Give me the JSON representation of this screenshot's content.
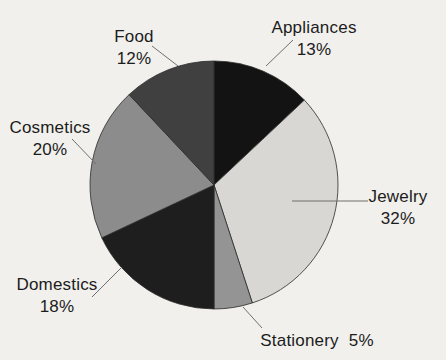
{
  "figure": {
    "background_color": "#f1f0ec",
    "text_color": "#1c1c1c",
    "leader_line_color": "#6f6f6f",
    "outline_color": "#2b2b2b"
  },
  "chart_data": {
    "type": "pie",
    "title": "",
    "direction": "clockwise",
    "start_angle_deg": 0,
    "total": 100,
    "legend_position": "none",
    "label_style": "outside-with-leader-lines",
    "slices": [
      {
        "label": "Appliances",
        "value": 13,
        "pct_text": "13%",
        "color": "#131313"
      },
      {
        "label": "Jewelry",
        "value": 32,
        "pct_text": "32%",
        "color": "#d8d7d3"
      },
      {
        "label": "Stationery",
        "value": 5,
        "pct_text": "5%",
        "color": "#949494"
      },
      {
        "label": "Domestics",
        "value": 18,
        "pct_text": "18%",
        "color": "#1e1e1e"
      },
      {
        "label": "Cosmetics",
        "value": 20,
        "pct_text": "20%",
        "color": "#8c8c8c"
      },
      {
        "label": "Food",
        "value": 12,
        "pct_text": "12%",
        "color": "#404040"
      }
    ]
  }
}
